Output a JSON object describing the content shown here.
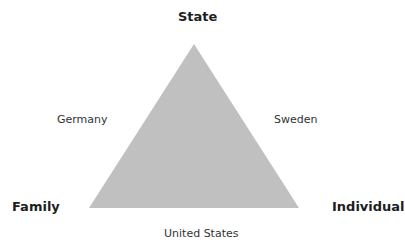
{
  "diagram": {
    "shape": "triangle",
    "fill_color": "#c0c0c0",
    "vertices": {
      "top": "State",
      "bottom_left": "Family",
      "bottom_right": "Individual"
    },
    "sides": {
      "left": "Germany",
      "right": "Sweden",
      "bottom": "United States"
    }
  }
}
